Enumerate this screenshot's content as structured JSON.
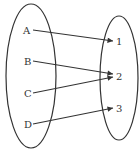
{
  "diagram": {
    "type": "mapping",
    "domain_set": {
      "elements": [
        "A",
        "B",
        "C",
        "D"
      ]
    },
    "codomain_set": {
      "elements": [
        "1",
        "2",
        "3"
      ]
    },
    "mappings": [
      {
        "from": "A",
        "to": "1"
      },
      {
        "from": "B",
        "to": "2"
      },
      {
        "from": "C",
        "to": "2"
      },
      {
        "from": "D",
        "to": "3"
      }
    ],
    "colors": {
      "stroke": "#333333",
      "background": "#ffffff"
    }
  }
}
